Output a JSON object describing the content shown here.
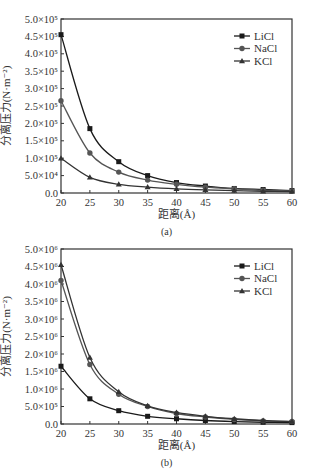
{
  "chart_data": [
    {
      "type": "line",
      "caption": "(a)",
      "title": "",
      "xlabel": "距离(Å)",
      "ylabel": "分离压力(N·m⁻²)",
      "x": [
        20,
        25,
        30,
        35,
        40,
        45,
        50,
        55,
        60
      ],
      "xlim": [
        20,
        60
      ],
      "ylim": [
        0,
        500000
      ],
      "xticks": [
        "20",
        "25",
        "30",
        "35",
        "40",
        "45",
        "50",
        "55",
        "60"
      ],
      "yticks": [
        "0.0",
        "5.0×10⁴",
        "1.0×10⁵",
        "1.5×10⁵",
        "2.0×10⁵",
        "2.5×10⁵",
        "3.0×10⁵",
        "3.5×10⁵",
        "4.0×10⁵",
        "4.5×10⁵",
        "5.0×10⁵"
      ],
      "grid": false,
      "legend_position": "upper right",
      "series": [
        {
          "name": "LiCl",
          "marker": "square",
          "values": [
            455000,
            185000,
            90000,
            50000,
            30000,
            20000,
            13000,
            10000,
            7000
          ]
        },
        {
          "name": "NaCl",
          "marker": "circle",
          "values": [
            265000,
            115000,
            60000,
            37000,
            25000,
            17000,
            12000,
            8000,
            6000
          ]
        },
        {
          "name": "KCl",
          "marker": "triangle",
          "values": [
            100000,
            45000,
            25000,
            17000,
            12000,
            9000,
            7000,
            5000,
            4000
          ]
        }
      ]
    },
    {
      "type": "line",
      "caption": "(b)",
      "title": "",
      "xlabel": "距离(Å)",
      "ylabel": "分离压力(N·m⁻²)",
      "x": [
        20,
        25,
        30,
        35,
        40,
        45,
        50,
        55,
        60
      ],
      "xlim": [
        20,
        60
      ],
      "ylim": [
        0,
        5000000
      ],
      "xticks": [
        "20",
        "25",
        "30",
        "35",
        "40",
        "45",
        "50",
        "55",
        "60"
      ],
      "yticks": [
        "0.0",
        "5.0×10⁵",
        "1.0×10⁶",
        "1.5×10⁶",
        "2.0×10⁶",
        "2.5×10⁶",
        "3.0×10⁶",
        "3.5×10⁶",
        "4.0×10⁶",
        "4.5×10⁶",
        "5.0×10⁶"
      ],
      "grid": false,
      "legend_position": "upper right",
      "series": [
        {
          "name": "LiCl",
          "marker": "square",
          "values": [
            1650000,
            720000,
            380000,
            220000,
            150000,
            100000,
            70000,
            50000,
            40000
          ]
        },
        {
          "name": "NaCl",
          "marker": "circle",
          "values": [
            4100000,
            1700000,
            850000,
            500000,
            300000,
            200000,
            130000,
            90000,
            70000
          ]
        },
        {
          "name": "KCl",
          "marker": "triangle",
          "values": [
            4550000,
            1900000,
            920000,
            520000,
            330000,
            220000,
            150000,
            100000,
            70000
          ]
        }
      ]
    }
  ]
}
